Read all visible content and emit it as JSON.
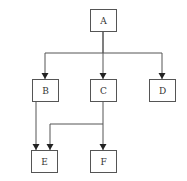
{
  "diagram": {
    "type": "hierarchy",
    "nodes": [
      {
        "id": "A",
        "label": "A",
        "x": 90,
        "y": 9,
        "w": 26,
        "h": 22
      },
      {
        "id": "B",
        "label": "B",
        "x": 32,
        "y": 79,
        "w": 26,
        "h": 22
      },
      {
        "id": "C",
        "label": "C",
        "x": 90,
        "y": 79,
        "w": 26,
        "h": 22
      },
      {
        "id": "D",
        "label": "D",
        "x": 149,
        "y": 79,
        "w": 26,
        "h": 22
      },
      {
        "id": "E",
        "label": "E",
        "x": 31,
        "y": 150,
        "w": 26,
        "h": 22
      },
      {
        "id": "F",
        "label": "F",
        "x": 90,
        "y": 150,
        "w": 26,
        "h": 22
      }
    ],
    "edges": [
      {
        "from": "A",
        "to": "B",
        "path": "M103,31 L103,53 L45,53 L45,79"
      },
      {
        "from": "A",
        "to": "C",
        "path": "M103,31 L103,79"
      },
      {
        "from": "A",
        "to": "D",
        "path": "M103,53 L162,53 L162,79"
      },
      {
        "from": "B",
        "to": "E",
        "path": "M36,101 L36,150"
      },
      {
        "from": "C",
        "to": "E",
        "path": "M103,101 L103,124 L50,124 L50,150"
      },
      {
        "from": "C",
        "to": "F",
        "path": "M103,124 L103,150"
      }
    ],
    "arrowheads": [
      {
        "to": "B",
        "x": 45,
        "y": 79
      },
      {
        "to": "C",
        "x": 103,
        "y": 79
      },
      {
        "to": "D",
        "x": 162,
        "y": 79
      },
      {
        "to": "E-from-B",
        "x": 36,
        "y": 150
      },
      {
        "to": "E-from-C",
        "x": 50,
        "y": 150
      },
      {
        "to": "F",
        "x": 103,
        "y": 150
      }
    ]
  }
}
